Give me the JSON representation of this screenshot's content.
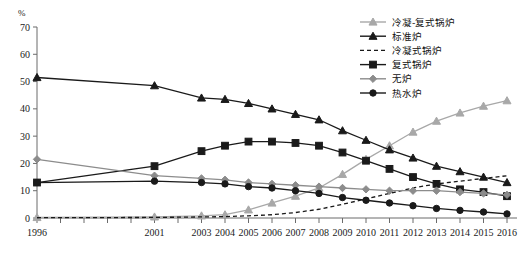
{
  "chart_data": {
    "type": "line",
    "title": "",
    "xlabel": "",
    "ylabel": "%",
    "ylim": [
      0,
      70
    ],
    "ytick_values": [
      0,
      10,
      20,
      30,
      40,
      50,
      60,
      70
    ],
    "grid": false,
    "legend_position": "top-right",
    "x": [
      1996,
      2001,
      2003,
      2004,
      2005,
      2006,
      2007,
      2008,
      2009,
      2010,
      2011,
      2012,
      2013,
      2014,
      2015,
      2016
    ],
    "xtick_years": [
      1996,
      1997,
      1998,
      1999,
      2000,
      2001,
      2002,
      2003,
      2004,
      2005,
      2006,
      2007,
      2008,
      2009,
      2010,
      2011,
      2012,
      2013,
      2014,
      2015,
      2016
    ],
    "xtick_labels_shown": [
      "1996",
      "2001",
      "2003",
      "2004",
      "2005",
      "2006",
      "2007",
      "2008",
      "2009",
      "2010",
      "2011",
      "2012",
      "2013",
      "2014",
      "2015",
      "2016"
    ],
    "series": [
      {
        "name": "冷凝-复式锅炉",
        "color": "#a8a8a8",
        "marker": "triangle",
        "dash": "none",
        "values": [
          0.2,
          0.4,
          0.8,
          1.2,
          3.0,
          5.5,
          8.0,
          11.0,
          16.0,
          21.5,
          26.5,
          31.5,
          35.5,
          38.5,
          41.0,
          43.0
        ]
      },
      {
        "name": "标准炉",
        "color": "#1a1a1a",
        "marker": "triangle",
        "dash": "none",
        "values": [
          51.5,
          48.5,
          44.0,
          43.5,
          42.0,
          40.0,
          38.0,
          36.0,
          32.0,
          28.5,
          25.0,
          22.0,
          19.0,
          17.0,
          15.0,
          13.0
        ]
      },
      {
        "name": "冷凝式锅炉",
        "color": "#1a1a1a",
        "marker": "none",
        "dash": "dashed",
        "values": [
          0.1,
          0.2,
          0.4,
          0.5,
          0.8,
          1.2,
          2.0,
          3.2,
          5.0,
          7.0,
          9.0,
          11.0,
          12.5,
          13.5,
          14.5,
          15.5
        ]
      },
      {
        "name": "复式锅炉",
        "color": "#1a1a1a",
        "marker": "square",
        "dash": "none",
        "values": [
          13.0,
          19.0,
          24.5,
          26.5,
          28.0,
          28.0,
          27.5,
          26.5,
          24.0,
          21.0,
          18.0,
          15.0,
          12.5,
          10.5,
          9.5,
          8.0
        ]
      },
      {
        "name": "无炉",
        "color": "#8c8c8c",
        "marker": "diamond",
        "dash": "none",
        "values": [
          21.5,
          15.5,
          14.5,
          14.0,
          13.0,
          12.5,
          12.0,
          11.5,
          11.0,
          10.5,
          10.0,
          10.0,
          10.0,
          9.5,
          9.0,
          8.5
        ]
      },
      {
        "name": "热水炉",
        "color": "#1a1a1a",
        "marker": "circle",
        "dash": "none",
        "values": [
          13.0,
          13.5,
          13.0,
          12.5,
          11.5,
          11.0,
          10.0,
          9.0,
          7.5,
          6.5,
          5.5,
          4.5,
          3.5,
          2.8,
          2.2,
          1.5
        ]
      }
    ]
  },
  "legend": {
    "items": [
      {
        "label": "冷凝-复式锅炉"
      },
      {
        "label": "标准炉"
      },
      {
        "label": "冷凝式锅炉"
      },
      {
        "label": "复式锅炉"
      },
      {
        "label": "无炉"
      },
      {
        "label": "热水炉"
      }
    ]
  },
  "axes": {
    "y_unit": "%"
  }
}
